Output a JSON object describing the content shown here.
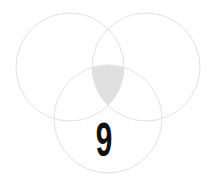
{
  "diagram": {
    "type": "venn",
    "circles": [
      {
        "name": "left",
        "cx": 70,
        "cy": 67,
        "r": 54
      },
      {
        "name": "right",
        "cx": 146,
        "cy": 67,
        "r": 54
      },
      {
        "name": "bottom",
        "cx": 108,
        "cy": 119,
        "r": 54
      }
    ],
    "stroke_color": "#e2e2e2",
    "highlight_fill": "#e0e0e0",
    "highlight_region": "intersection of all three circles",
    "label": "9"
  }
}
